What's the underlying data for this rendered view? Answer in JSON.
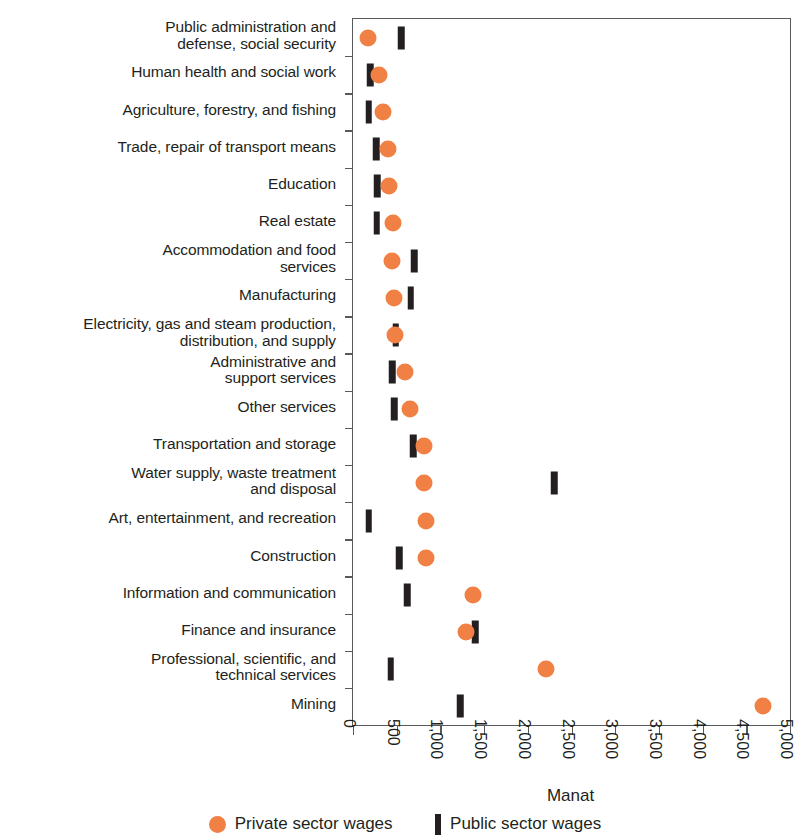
{
  "chart_data": {
    "type": "scatter",
    "title": "",
    "xlabel": "Manat",
    "ylabel": "",
    "xlim": [
      0,
      5000
    ],
    "xticks": [
      0,
      500,
      1000,
      1500,
      2000,
      2500,
      3000,
      3500,
      4000,
      4500,
      5000
    ],
    "xtick_labels": [
      "0",
      "500",
      "1,000",
      "1,500",
      "2,000",
      "2,500",
      "3,000",
      "3,500",
      "4,000",
      "4,500",
      "5,000"
    ],
    "grid": false,
    "legend_position": "bottom",
    "orientation": "horizontal",
    "categories": [
      "Public administration and\ndefense, social security",
      "Human health and social work",
      "Agriculture, forestry, and fishing",
      "Trade, repair of transport means",
      "Education",
      "Real estate",
      "Accommodation and food\nservices",
      "Manufacturing",
      "Electricity, gas and steam production,\ndistribution, and supply",
      "Administrative and\nsupport services",
      "Other services",
      "Transportation and storage",
      "Water supply, waste treatment\nand disposal",
      "Art, entertainment, and recreation",
      "Construction",
      "Information and communication",
      "Finance and insurance",
      "Professional, scientific, and\ntechnical services",
      "Mining"
    ],
    "series": [
      {
        "name": "Private sector wages",
        "marker": "circle",
        "color": "#f08043",
        "values": [
          170,
          300,
          345,
          400,
          410,
          460,
          450,
          465,
          480,
          600,
          650,
          810,
          810,
          830,
          840,
          1370,
          1290,
          2210,
          4690
        ]
      },
      {
        "name": "Public sector wages",
        "marker": "bar",
        "color": "#231f20",
        "values": [
          550,
          195,
          180,
          265,
          275,
          270,
          700,
          660,
          490,
          450,
          470,
          690,
          2300,
          180,
          530,
          620,
          1400,
          430,
          1225
        ]
      }
    ]
  },
  "legend": {
    "items": [
      {
        "label": "Private sector wages",
        "marker": "circle-marker",
        "color": "#f08043"
      },
      {
        "label": "Public sector wages",
        "marker": "bar-marker",
        "color": "#231f20"
      }
    ]
  },
  "axis": {
    "x_title": "Manat"
  }
}
